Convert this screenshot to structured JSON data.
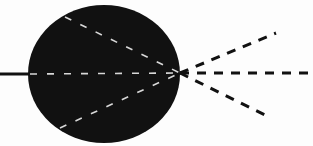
{
  "diagram": {
    "colors": {
      "background": "#fdfdfd",
      "sphere": "#111111",
      "inner_dash": "#d8d8d8",
      "outer_dash": "#111111",
      "solid_line": "#111111"
    },
    "sphere": {
      "cx": 104,
      "cy": 74,
      "rx": 76,
      "ry": 69
    },
    "focal_point": {
      "x": 180,
      "y": 73
    },
    "incoming_line": {
      "x1": 0,
      "y1": 74,
      "x2": 30,
      "y2": 74
    },
    "inner_rays": [
      {
        "name": "inner-upper",
        "x1": 65,
        "y1": 17,
        "x2": 180,
        "y2": 73
      },
      {
        "name": "inner-middle",
        "x1": 30,
        "y1": 74,
        "x2": 180,
        "y2": 73
      },
      {
        "name": "inner-lower",
        "x1": 60,
        "y1": 128,
        "x2": 180,
        "y2": 73
      }
    ],
    "outer_rays": [
      {
        "name": "outer-upper",
        "x1": 180,
        "y1": 73,
        "x2": 276,
        "y2": 33
      },
      {
        "name": "outer-middle",
        "x1": 180,
        "y1": 73,
        "x2": 313,
        "y2": 73
      },
      {
        "name": "outer-lower",
        "x1": 180,
        "y1": 73,
        "x2": 267,
        "y2": 116
      }
    ]
  }
}
